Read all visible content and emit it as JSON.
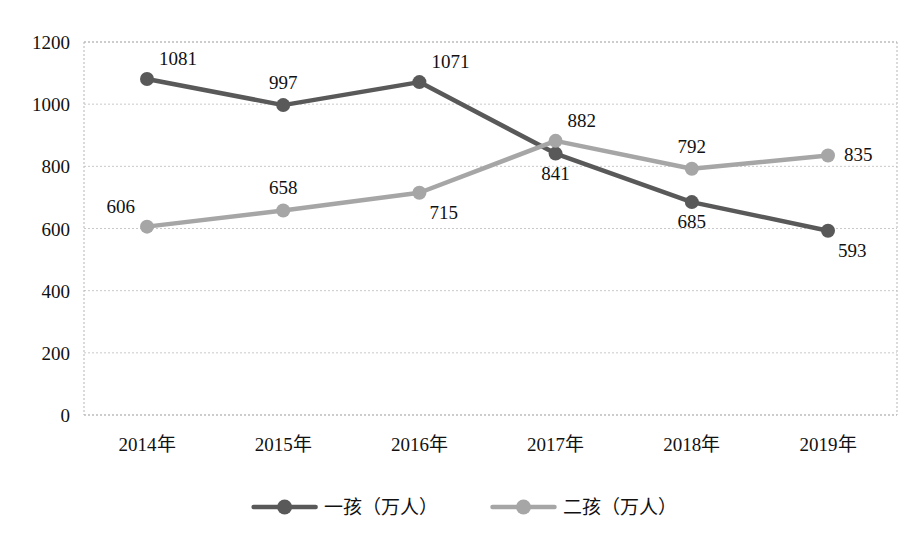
{
  "chart_data": {
    "type": "line",
    "title": "",
    "subtitle": "",
    "xlabel": "",
    "ylabel": "",
    "categories": [
      "2014年",
      "2015年",
      "2016年",
      "2017年",
      "2018年",
      "2019年"
    ],
    "ylim": [
      0,
      1200
    ],
    "ytick_step": 200,
    "yticks": [
      0,
      200,
      400,
      600,
      800,
      1000,
      1200
    ],
    "ytick_labels": [
      "0",
      "200",
      "400",
      "600",
      "800",
      "1000",
      "1200"
    ],
    "grid": true,
    "grid_style": "dashed-horizontal",
    "legend_position": "bottom",
    "show_data_labels": true,
    "series": [
      {
        "name": "一孩（万人）",
        "color": "#595959",
        "marker": "circle",
        "values": [
          1081,
          997,
          1071,
          841,
          685,
          593
        ],
        "labels": [
          "1081",
          "997",
          "1071",
          "841",
          "685",
          "593"
        ],
        "label_positions": [
          "above-right",
          "above",
          "above-right",
          "below",
          "below",
          "below-right"
        ]
      },
      {
        "name": "二孩（万人）",
        "color": "#a6a6a6",
        "marker": "circle",
        "values": [
          606,
          658,
          715,
          882,
          792,
          835
        ],
        "labels": [
          "606",
          "658",
          "715",
          "882",
          "792",
          "835"
        ],
        "label_positions": [
          "above-left",
          "above",
          "below-right",
          "above-right",
          "above",
          "right"
        ]
      }
    ]
  },
  "colors": {
    "series_one": "#595959",
    "series_two": "#a6a6a6",
    "grid": "#c9c9c9",
    "frame": "#b5b5b5",
    "text": "#111111",
    "background": "#ffffff"
  },
  "legend": {
    "items": [
      {
        "label": "一孩（万人）",
        "color": "#595959"
      },
      {
        "label": "二孩（万人）",
        "color": "#a6a6a6"
      }
    ]
  }
}
